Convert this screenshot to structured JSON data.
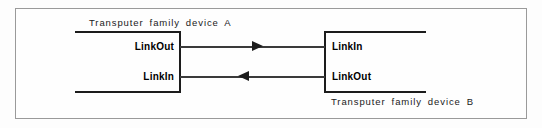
{
  "diagram": {
    "devices": [
      {
        "id": "device-a",
        "caption": "Transputer  family  device  A",
        "ports": [
          {
            "name": "LinkOut",
            "label": "LinkOut"
          },
          {
            "name": "LinkIn",
            "label": "LinkIn"
          }
        ]
      },
      {
        "id": "device-b",
        "caption": "Transputer  family  device   B",
        "ports": [
          {
            "name": "LinkIn",
            "label": "LinkIn"
          },
          {
            "name": "LinkOut",
            "label": "LinkOut"
          }
        ]
      }
    ],
    "connections": [
      {
        "name": "a-linkout-to-b-linkin",
        "direction": "right",
        "from": "LinkOut",
        "to": "LinkIn"
      },
      {
        "name": "b-linkout-to-a-linkin",
        "direction": "left",
        "from": "LinkOut",
        "to": "LinkIn"
      }
    ],
    "colors": {
      "line": "#1c1c1c",
      "frame": "#9a9a9a",
      "text": "#1a1a1a",
      "background": "#fdfdfd"
    }
  }
}
